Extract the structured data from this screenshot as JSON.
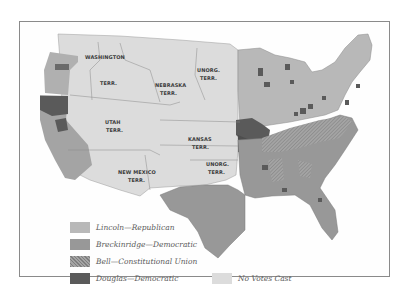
{
  "map": {
    "title": "1860 Presidential Election by County",
    "territory_labels": [
      {
        "id": "washington",
        "lines": [
          "WASHINGTON",
          "TERR."
        ]
      },
      {
        "id": "nebraska",
        "lines": [
          "NEBRASKA",
          "TERR."
        ]
      },
      {
        "id": "unorg-north",
        "lines": [
          "UNORG.",
          "TERR."
        ]
      },
      {
        "id": "utah",
        "lines": [
          "UTAH",
          "TERR."
        ]
      },
      {
        "id": "kansas",
        "lines": [
          "KANSAS",
          "TERR."
        ]
      },
      {
        "id": "new-mexico",
        "lines": [
          "NEW MEXICO",
          "TERR."
        ]
      },
      {
        "id": "unorg-south",
        "lines": [
          "UNORG.",
          "TERR."
        ]
      }
    ]
  },
  "legend": {
    "items": [
      {
        "label": "Lincoln—Republican",
        "color": "#b8b8b8",
        "pattern": "solid"
      },
      {
        "label": "Breckinridge—Democratic",
        "color": "#989898",
        "pattern": "solid"
      },
      {
        "label": "Bell—Constitutional Union",
        "color": "#9a9a9a",
        "pattern": "hatch"
      },
      {
        "label": "Douglas—Democratic",
        "color": "#5a5a5a",
        "pattern": "solid"
      },
      {
        "label": "No Votes Cast",
        "color": "#dcdcdc",
        "pattern": "solid"
      }
    ]
  },
  "colors": {
    "lincoln": "#b8b8b8",
    "breckinridge": "#989898",
    "bell": "#9a9a9a",
    "douglas": "#5a5a5a",
    "no_votes": "#dcdcdc",
    "border": "#7a7a7a",
    "frame": "#8a8a8a"
  }
}
